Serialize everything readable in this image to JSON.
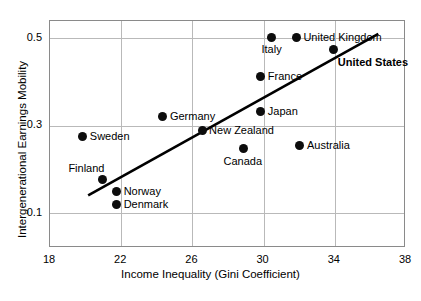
{
  "chart_data": {
    "type": "scatter",
    "title": "",
    "xlabel": "Income Inequality (Gini Coefficient)",
    "ylabel": "Intergenerational Earnings Mobility",
    "xlim": [
      18,
      38
    ],
    "ylim": [
      0.02,
      0.54
    ],
    "xticks": [
      "18",
      "22",
      "26",
      "30",
      "34",
      "38"
    ],
    "yticks": [
      "0.5",
      "0.3",
      "0.1"
    ],
    "grid": true,
    "legend": "none",
    "points": [
      {
        "label": "Sweden",
        "x": 19.9,
        "y": 0.272,
        "label_pos": "right",
        "bold": false
      },
      {
        "label": "Finland",
        "x": 21.0,
        "y": 0.175,
        "label_pos": "above-left",
        "bold": false
      },
      {
        "label": "Norway",
        "x": 21.8,
        "y": 0.147,
        "label_pos": "right",
        "bold": false
      },
      {
        "label": "Denmark",
        "x": 21.8,
        "y": 0.117,
        "label_pos": "right",
        "bold": false
      },
      {
        "label": "Germany",
        "x": 24.4,
        "y": 0.32,
        "label_pos": "right",
        "bold": false
      },
      {
        "label": "New Zealand",
        "x": 26.6,
        "y": 0.287,
        "label_pos": "right",
        "bold": false
      },
      {
        "label": "Canada",
        "x": 28.9,
        "y": 0.245,
        "label_pos": "below",
        "bold": false
      },
      {
        "label": "Japan",
        "x": 29.9,
        "y": 0.33,
        "label_pos": "right",
        "bold": false
      },
      {
        "label": "France",
        "x": 29.9,
        "y": 0.41,
        "label_pos": "right",
        "bold": false
      },
      {
        "label": "Australia",
        "x": 32.1,
        "y": 0.253,
        "label_pos": "right",
        "bold": false
      },
      {
        "label": "Italy",
        "x": 30.5,
        "y": 0.5,
        "label_pos": "below",
        "bold": false
      },
      {
        "label": "United Kingdom",
        "x": 31.9,
        "y": 0.5,
        "label_pos": "right",
        "bold": false
      },
      {
        "label": "United States",
        "x": 34.0,
        "y": 0.473,
        "label_pos": "below-right",
        "bold": true
      }
    ],
    "trendline": {
      "x0": 20.2,
      "y0": 0.138,
      "x1": 36.5,
      "y1": 0.508,
      "color": "#000000",
      "width": 2.6
    }
  }
}
